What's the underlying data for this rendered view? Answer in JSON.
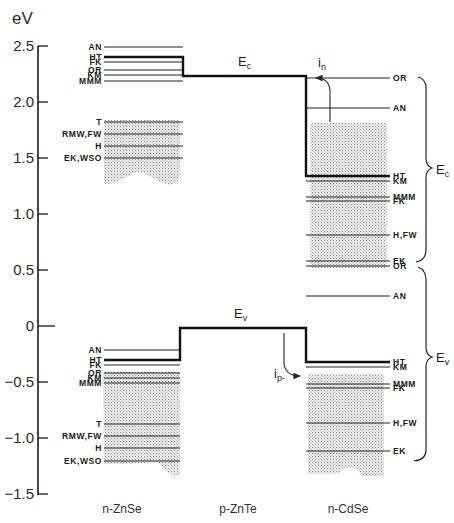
{
  "axis": {
    "unit": "eV",
    "ticks": [
      {
        "label": "2.5",
        "value": 2.5
      },
      {
        "label": "2.0",
        "value": 2.0
      },
      {
        "label": "1.5",
        "value": 1.5
      },
      {
        "label": "1.0",
        "value": 1.0
      },
      {
        "label": "0.5",
        "value": 0.5
      },
      {
        "label": "0",
        "value": 0
      },
      {
        "label": "−0.5",
        "value": -0.5
      },
      {
        "label": "−1.0",
        "value": -1.0
      },
      {
        "label": "−1.5",
        "value": -1.5
      }
    ]
  },
  "materials": {
    "left": "n-ZnSe",
    "middle": "p-ZnTe",
    "right": "n-CdSe"
  },
  "band_labels": {
    "ec": "E",
    "ec_sub": "c",
    "ev": "E",
    "ev_sub": "v",
    "in": "i",
    "in_sub": "n",
    "ip": "i",
    "ip_sub": "p-"
  },
  "brace_labels": {
    "ec": "E",
    "ec_sub": "c",
    "ev": "E",
    "ev_sub": "v"
  },
  "left_levels_upper": [
    {
      "label": "AN",
      "y": 47
    },
    {
      "label": "HT",
      "y": 57
    },
    {
      "label": "FK",
      "y": 62
    },
    {
      "label": "OR",
      "y": 70
    },
    {
      "label": "KM",
      "y": 75
    },
    {
      "label": "MMM",
      "y": 81
    },
    {
      "label": "T",
      "y": 122
    },
    {
      "label": "RMW,FW",
      "y": 134
    },
    {
      "label": "H",
      "y": 146
    },
    {
      "label": "EK,WSO",
      "y": 158
    }
  ],
  "left_levels_lower": [
    {
      "label": "AN",
      "y": 350
    },
    {
      "label": "HT",
      "y": 360
    },
    {
      "label": "FK",
      "y": 365
    },
    {
      "label": "OR",
      "y": 373
    },
    {
      "label": "KM",
      "y": 378
    },
    {
      "label": "MMM",
      "y": 383
    },
    {
      "label": "T",
      "y": 424
    },
    {
      "label": "RMW,FW",
      "y": 436
    },
    {
      "label": "H",
      "y": 448
    },
    {
      "label": "EK,WSO",
      "y": 461
    }
  ],
  "right_levels_upper": [
    {
      "label": "OR",
      "y": 78
    },
    {
      "label": "AN",
      "y": 108
    },
    {
      "label": "HT",
      "y": 176
    },
    {
      "label": "KM",
      "y": 181
    },
    {
      "label": "MMM",
      "y": 197
    },
    {
      "label": "FK",
      "y": 201
    },
    {
      "label": "H,FW",
      "y": 235
    },
    {
      "label": "EK",
      "y": 261
    }
  ],
  "right_levels_lower": [
    {
      "label": "OR",
      "y": 266
    },
    {
      "label": "AN",
      "y": 296
    },
    {
      "label": "HT",
      "y": 362
    },
    {
      "label": "KM",
      "y": 367
    },
    {
      "label": "MMM",
      "y": 384
    },
    {
      "label": "FK",
      "y": 388
    },
    {
      "label": "H,FW",
      "y": 423
    },
    {
      "label": "EK",
      "y": 451
    }
  ]
}
